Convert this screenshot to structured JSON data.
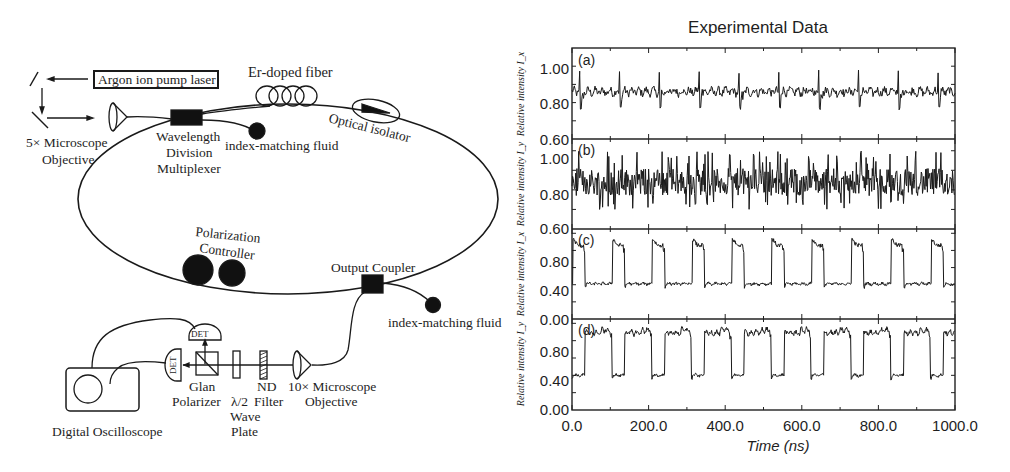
{
  "diagram": {
    "labels": {
      "argon_laser": "Argon ion pump laser",
      "er_fiber": "Er-doped fiber",
      "objective_5x_line1": "5× Microscope",
      "objective_5x_line2": "Objective",
      "wdm_line1": "Wavelength",
      "wdm_line2": "Division",
      "wdm_line3": "Multiplexer",
      "index_fluid_top": "index-matching fluid",
      "optical_isolator": "Optical isolator",
      "polarization_line1": "Polarization",
      "polarization_line2": "Controller",
      "output_coupler": "Output Coupler",
      "index_fluid_bottom": "index-matching fluid",
      "det_top": "DET",
      "det_left": "DET",
      "glan_line1": "Glan",
      "glan_line2": "Polarizer",
      "waveplate_line1": "λ/2",
      "waveplate_line2": "Wave",
      "waveplate_line3": "Plate",
      "nd_line1": "ND",
      "nd_line2": "Filter",
      "objective_10x_line1": "10× Microscope",
      "objective_10x_line2": "Objective",
      "oscilloscope": "Digital Oscilloscope"
    }
  },
  "chart_data": {
    "type": "line",
    "title": "Experimental Data",
    "xlabel": "Time (ns)",
    "xlim": [
      0,
      1000
    ],
    "x_ticks": [
      "0.0",
      "200.0",
      "400.0",
      "600.0",
      "800.0",
      "1000.0"
    ],
    "grid": false,
    "legend": "none",
    "panels": [
      {
        "id": "a",
        "label": "(a)",
        "ylabel": "Relative intensity I_x",
        "ylim": [
          0.6,
          1.1
        ],
        "y_ticks": [
          "1.00",
          "0.80",
          "0.60"
        ],
        "description": "Noisy quasi-continuous signal around 0.86 with periodic spikes to ~0.98 and dips to ~0.76 every ~104 ns",
        "mean": 0.86,
        "noise": 0.035,
        "spike_period_ns": 104,
        "spike_high": 0.98,
        "spike_low": 0.76
      },
      {
        "id": "b",
        "label": "(b)",
        "ylabel": "Relative intensity I_y",
        "ylim": [
          0.6,
          1.05
        ],
        "y_ticks": [
          "1.00",
          "0.80",
          "0.60"
        ],
        "description": "Dense noisy signal around 0.84, fluctuating between ~0.70 and ~1.00",
        "mean": 0.84,
        "noise": 0.07
      },
      {
        "id": "c",
        "label": "(c)",
        "ylabel": "Relative intensity I_x",
        "ylim": [
          0.0,
          1.1
        ],
        "y_ticks": [
          "0.80",
          "0.40",
          "0.00"
        ],
        "description": "Square pulse train: short high pulses (~0.85-0.95, ~30 ns wide) on a 0.40 baseline, period ~104 ns",
        "period_ns": 104,
        "high_duration_ns": 32,
        "high_level": 0.86,
        "low_level": 0.41,
        "phase_ns": 2
      },
      {
        "id": "d",
        "label": "(d)",
        "ylabel": "Relative intensity I_y",
        "ylim": [
          0.0,
          1.1
        ],
        "y_ticks": [
          "0.80",
          "0.40",
          "0.00"
        ],
        "description": "Complementary square wave: long high states (~0.88-0.95, ~70 ns) and short low states (~0.40, ~34 ns), period ~104 ns",
        "period_ns": 104,
        "high_duration_ns": 70,
        "high_level": 0.89,
        "low_level": 0.4,
        "phase_ns": 34
      }
    ]
  }
}
